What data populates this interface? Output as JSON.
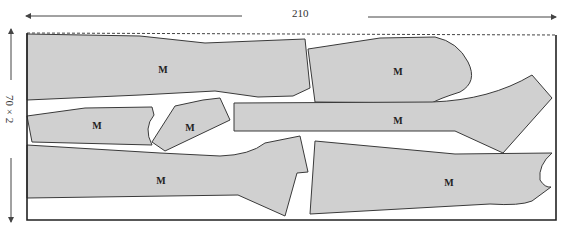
{
  "diagram": {
    "width_label": "210",
    "height_label": "70 × 2",
    "piece_label": "M",
    "colors": {
      "piece_fill": "#d0d0d0",
      "piece_stroke": "#3a3a3a",
      "frame": "#222222",
      "background": "#ffffff"
    },
    "pieces": [
      {
        "id": "p1",
        "label": "M"
      },
      {
        "id": "p2",
        "label": "M"
      },
      {
        "id": "p3",
        "label": "M"
      },
      {
        "id": "p4",
        "label": "M"
      },
      {
        "id": "p5",
        "label": "M"
      },
      {
        "id": "p6",
        "label": "M"
      },
      {
        "id": "p7",
        "label": "M"
      }
    ]
  }
}
